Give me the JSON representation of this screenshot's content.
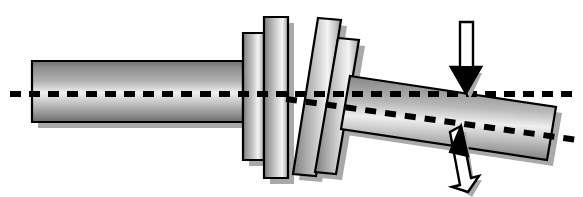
{
  "figure": {
    "canvas": {
      "width": 583,
      "height": 197,
      "background": "#ffffff"
    },
    "style": {
      "outline_color": "#000000",
      "outline_width": 2.2,
      "shadow_color": "#a9a9a9",
      "metal_edge_dark": "#6f6f6f",
      "metal_mid": "#9a9a9a",
      "metal_highlight": "#f2f2f2",
      "dash_color": "#000000",
      "arrow_fill": "#ffffff",
      "arrow_outline": "#000000"
    },
    "parts": [
      {
        "id": "input-shaft",
        "label": "Input shaft (horizontal)",
        "kind": "cylinder",
        "orientation": "horizontal",
        "points": "32,61 243,61 243,122 32,122"
      },
      {
        "id": "collar-plate-1",
        "label": "Coupling plate 1 (aligned)",
        "kind": "plate",
        "orientation": "vertical",
        "points": "243,33 264,33 264,160 243,160"
      },
      {
        "id": "collar-plate-2",
        "label": "Coupling plate 2 (aligned)",
        "kind": "plate",
        "orientation": "vertical",
        "points": "264,17 288,17 288,178 264,178"
      },
      {
        "id": "collar-plate-3",
        "label": "Coupling plate 3 (tilted)",
        "kind": "plate",
        "orientation": "tilted",
        "points": "318,18 341,20 316,176 293,174"
      },
      {
        "id": "collar-plate-4",
        "label": "Coupling plate 4 (tilted)",
        "kind": "plate",
        "orientation": "tilted",
        "points": "338,38 359,40 336,174 315,172"
      },
      {
        "id": "output-shaft",
        "label": "Output shaft (misaligned / tilted)",
        "kind": "cylinder",
        "orientation": "tilted",
        "points": "350,76 556,107 547,160 341,129"
      }
    ],
    "axes": [
      {
        "id": "reference-axis",
        "label": "Reference centreline (true axis)",
        "orientation": "horizontal",
        "x1": 10,
        "y1": 94,
        "x2": 575,
        "y2": 94,
        "dash": "11 8",
        "width": 6
      },
      {
        "id": "deflected-axis",
        "label": "Deflected shaft centreline",
        "orientation": "tilted",
        "x1": 286,
        "y1": 99,
        "x2": 578,
        "y2": 140,
        "dash": "11 9",
        "width": 6
      }
    ],
    "arrows": [
      {
        "id": "load-arrow-top",
        "label": "Applied load (downward)",
        "direction": "down",
        "tip_x": 466,
        "tip_y": 93,
        "tail_x": 466,
        "tail_y": 22,
        "shaft_width": 13,
        "head_width": 30,
        "head_length": 26
      },
      {
        "id": "load-arrow-bottom",
        "label": "Reaction load (upward)",
        "direction": "up",
        "tip_x": 461,
        "tip_y": 126,
        "tail_x": 450,
        "tail_y": 192,
        "shaft_width": 13,
        "head_width": 30,
        "head_length": 26
      }
    ]
  }
}
